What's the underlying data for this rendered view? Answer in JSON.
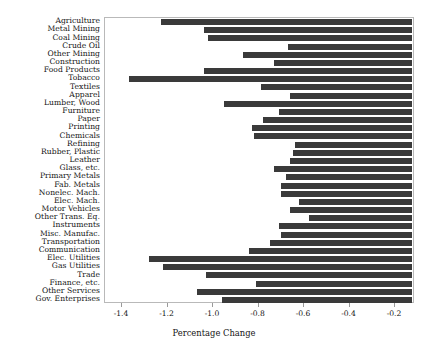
{
  "chart_data": {
    "type": "bar",
    "orientation": "horizontal",
    "title": "",
    "xlabel": "Percentage Change",
    "ylabel": "",
    "xlim": [
      -1.5,
      -0.1
    ],
    "ylim": null,
    "grid": false,
    "legend": null,
    "bar_color": "#3a3a3a",
    "bar_right_edge_value": -0.125,
    "xticks": [
      -1.4,
      -1.2,
      -1.0,
      -0.8,
      -0.6,
      -0.4,
      -0.2
    ],
    "xticklabels": [
      "-1.4",
      "-1.2",
      "-1.0",
      "-0.8",
      "-0.6",
      "-0.4",
      "-0.2"
    ],
    "categories": [
      "Agriculture",
      "Metal Mining",
      "Coal Mining",
      "Crude Oil",
      "Other Mining",
      "Construction",
      "Food Products",
      "Tobacco",
      "Textiles",
      "Apparel",
      "Lumber, Wood",
      "Furniture",
      "Paper",
      "Printing",
      "Chemicals",
      "Refining",
      "Rubber, Plastic",
      "Leather",
      "Glass, etc.",
      "Primary Metals",
      "Fab. Metals",
      "Nonelec. Mach.",
      "Elec. Mach.",
      "Motor Vehicles",
      "Other Trans. Eq.",
      "Instruments",
      "Misc. Manufac.",
      "Transportation",
      "Communication",
      "Elec. Utilities",
      "Gas Utilities",
      "Trade",
      "Finance, etc.",
      "Other Services",
      "Gov. Enterprises"
    ],
    "values": [
      -1.23,
      -1.04,
      -1.02,
      -0.67,
      -0.87,
      -0.73,
      -1.04,
      -1.37,
      -0.79,
      -0.66,
      -0.95,
      -0.71,
      -0.78,
      -0.83,
      -0.82,
      -0.64,
      -0.65,
      -0.66,
      -0.73,
      -0.68,
      -0.7,
      -0.7,
      -0.62,
      -0.66,
      -0.58,
      -0.71,
      -0.7,
      -0.75,
      -0.84,
      -1.28,
      -1.22,
      -1.03,
      -0.81,
      -1.07,
      -0.96
    ]
  },
  "axis": {
    "xlabel": "Percentage Change"
  }
}
